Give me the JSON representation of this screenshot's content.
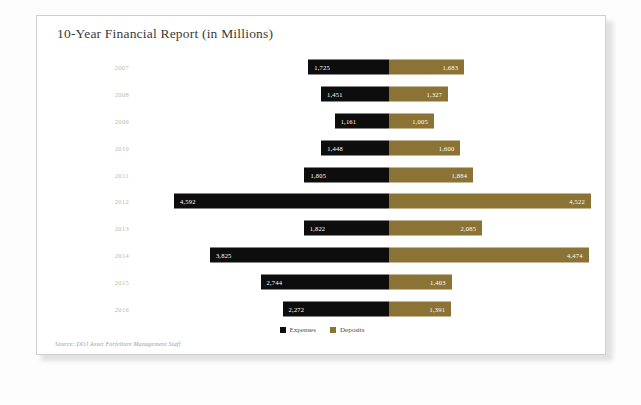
{
  "card": {
    "title": "10-Year Financial Report (in Millions)",
    "source_note": "Source: DOJ Asset Forfeiture Management Staff"
  },
  "legend": {
    "position": "bottom-center",
    "items": [
      {
        "label": "Expenses",
        "color": "#0d0d0d",
        "swatch_name": "expenses"
      },
      {
        "label": "Deposits",
        "color": "#8a7335",
        "swatch_name": "deposits"
      }
    ]
  },
  "colors": {
    "expenses": "#0d0d0d",
    "deposits": "#8a7335",
    "card_background": "#ffffff",
    "page_background": "#fdfdfd",
    "title_text": "#3a3a3a",
    "axis_label_text": "#b9b9b9",
    "bar_value_text": "#ffffff"
  },
  "chart_data": {
    "type": "bar",
    "orientation": "horizontal-diverging",
    "title": "10-Year Financial Report (in Millions)",
    "xlabel": "",
    "ylabel": "",
    "grid": false,
    "legend_position": "bottom-center",
    "categories": [
      "2007",
      "2008",
      "2009",
      "2010",
      "2011",
      "2012",
      "2013",
      "2014",
      "2015",
      "2016"
    ],
    "series": [
      {
        "name": "Expenses",
        "color": "#0d0d0d",
        "direction": "left",
        "values": [
          1725,
          1451,
          1161,
          1448,
          1805,
          4592,
          1822,
          3825,
          2744,
          2272
        ],
        "labels": [
          "1,725",
          "1,451",
          "1,161",
          "1,448",
          "1,805",
          "4,592",
          "1,822",
          "3,825",
          "2,744",
          "2,272"
        ]
      },
      {
        "name": "Deposits",
        "color": "#8a7335",
        "direction": "right",
        "values": [
          1683,
          1327,
          1005,
          1600,
          1884,
          4522,
          2085,
          4474,
          1403,
          1391
        ],
        "labels": [
          "1,683",
          "1,327",
          "1,005",
          "1,600",
          "1,884",
          "4,522",
          "2,085",
          "4,474",
          "1,403",
          "1,391"
        ]
      }
    ],
    "max_value": 4592
  }
}
